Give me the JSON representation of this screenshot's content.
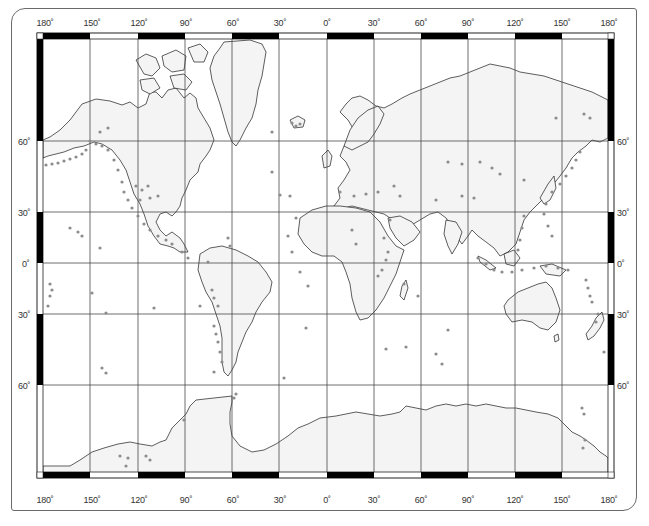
{
  "map": {
    "projection": "Mercator",
    "colors": {
      "land": "#f4f4f4",
      "ocean": "#ffffff",
      "coastline": "#1a1a1a",
      "graticule": "#4a4a4a",
      "frame_dark": "#000000",
      "frame_light": "#ffffff",
      "markers": "#8c8c8c"
    },
    "longitude_labels_top": [
      "180˚",
      "150˚",
      "120˚",
      "90˚",
      "60˚",
      "30˚",
      "0˚",
      "30˚",
      "60˚",
      "90˚",
      "120˚",
      "150˚",
      "180˚"
    ],
    "longitude_labels_bottom": [
      "180˚",
      "150˚",
      "120˚",
      "90˚",
      "60˚",
      "30˚",
      "0˚",
      "30˚",
      "60˚",
      "90˚",
      "120˚",
      "150˚",
      "180˚"
    ],
    "latitude_labels_left": [
      "60˚",
      "30˚",
      "0˚",
      "30˚",
      "60˚"
    ],
    "latitude_labels_right": [
      "60˚",
      "30˚",
      "0˚",
      "30˚",
      "60˚"
    ],
    "marker_description": "gray dots marking active volcanoes / seismic features"
  }
}
